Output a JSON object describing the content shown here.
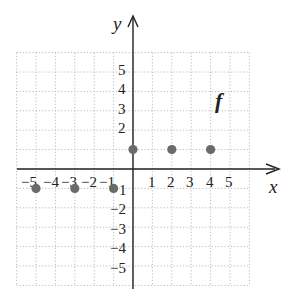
{
  "chart_data": {
    "type": "scatter",
    "title": "",
    "xlabel": "x",
    "ylabel": "y",
    "function_label": "f",
    "xlim": [
      -6,
      6
    ],
    "ylim": [
      -6,
      6
    ],
    "grid": true,
    "x_ticks": [
      -5,
      -4,
      -3,
      -2,
      -1,
      1,
      2,
      3,
      4,
      5
    ],
    "y_ticks": [
      5,
      4,
      3,
      2,
      -1,
      -2,
      -3,
      -4,
      -5
    ],
    "series": [
      {
        "name": "f",
        "points": [
          {
            "x": -5,
            "y": -1
          },
          {
            "x": -3,
            "y": -1
          },
          {
            "x": -1,
            "y": -1
          },
          {
            "x": 0,
            "y": 1
          },
          {
            "x": 2,
            "y": 1
          },
          {
            "x": 4,
            "y": 1
          }
        ]
      }
    ],
    "point_color": "#6b6b6b"
  },
  "labels": {
    "x_axis": "x",
    "y_axis": "y",
    "function": "f",
    "x_ticks": [
      "−5",
      "−4",
      "−3",
      "−2",
      "−1",
      "1",
      "2",
      "3",
      "4",
      "5"
    ],
    "y_ticks_pos": [
      "5",
      "4",
      "3",
      "2"
    ],
    "y_ticks_neg": [
      "1",
      "−2",
      "−3",
      "−4",
      "−5"
    ]
  }
}
